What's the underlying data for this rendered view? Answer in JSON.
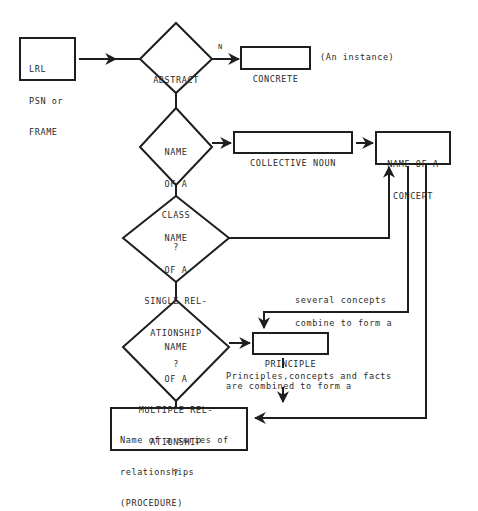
{
  "diagram": {
    "nodes": {
      "start": {
        "type": "box",
        "lines": [
          "LRL",
          "PSN or",
          "FRAME"
        ]
      },
      "abstract": {
        "type": "decision",
        "lines": [
          "ABSTRACT"
        ]
      },
      "concrete": {
        "type": "box",
        "lines": [
          "CONCRETE"
        ]
      },
      "class_q": {
        "type": "decision",
        "lines": [
          "NAME",
          "OF A",
          "CLASS",
          "?"
        ]
      },
      "collective_noun": {
        "type": "box",
        "lines": [
          "COLLECTIVE NOUN"
        ]
      },
      "concept": {
        "type": "box",
        "lines": [
          "NAME OF A",
          "CONCEPT"
        ]
      },
      "single_q": {
        "type": "decision",
        "lines": [
          "NAME",
          "OF A",
          "SINGLE REL-",
          "ATIONSHIP",
          "?"
        ]
      },
      "multiple_q": {
        "type": "decision",
        "lines": [
          "NAME",
          "OF A",
          "MULTIPLE REL-",
          "ATIONSHIP",
          "?"
        ]
      },
      "principle": {
        "type": "box",
        "lines": [
          "PRINCIPLE"
        ]
      },
      "procedure": {
        "type": "box",
        "lines": [
          "Name of a series of",
          "relationships",
          "(PROCEDURE)"
        ]
      }
    },
    "labels": {
      "abstract_no": "N",
      "concrete_note": "(An instance)",
      "concepts_top": "several concepts",
      "concepts_bottom": "combine to form a",
      "principles_line1": "Principles,concepts and facts",
      "principles_line2": "are combined to form a"
    },
    "edges": [
      {
        "from": "start",
        "to": "abstract"
      },
      {
        "from": "abstract",
        "to": "concrete",
        "label": "N"
      },
      {
        "from": "abstract",
        "to": "class_q"
      },
      {
        "from": "class_q",
        "to": "collective_noun"
      },
      {
        "from": "collective_noun",
        "to": "concept"
      },
      {
        "from": "class_q",
        "to": "single_q"
      },
      {
        "from": "single_q",
        "to": "concept"
      },
      {
        "from": "single_q",
        "to": "multiple_q"
      },
      {
        "from": "concept",
        "to": "principle",
        "label": "several concepts combine to form a"
      },
      {
        "from": "multiple_q",
        "to": "principle"
      },
      {
        "from": "multiple_q",
        "to": "procedure"
      },
      {
        "from": "principle",
        "to": "procedure",
        "label": "Principles,concepts and facts are combined to form a"
      },
      {
        "from": "concept",
        "to": "procedure"
      }
    ]
  },
  "style": {
    "stroke": "#1e1e1e",
    "text": "#2a2a2a",
    "background": "#ffffff"
  }
}
